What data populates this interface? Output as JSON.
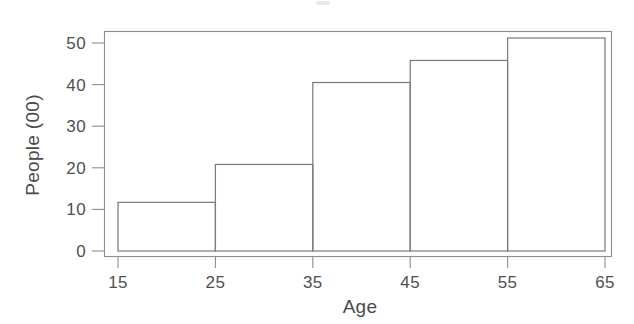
{
  "figure": {
    "background_color": "#ffffff",
    "line_color": "#8e8e8e",
    "text_color": "#4a4a4a"
  },
  "chart_data": {
    "type": "bar",
    "title": "",
    "subtitle": "",
    "xlabel": "Age",
    "ylabel": "People (00)",
    "xlim": [
      15,
      65
    ],
    "ylim": [
      0,
      53
    ],
    "grid": false,
    "legend": null,
    "bin_width": 10,
    "categories": [
      "15-25",
      "25-35",
      "35-45",
      "45-55",
      "55-65"
    ],
    "bin_edges": [
      15,
      25,
      35,
      45,
      55,
      65
    ],
    "values": [
      11.7,
      20.8,
      40.5,
      45.8,
      51.2
    ],
    "xticks": [
      15,
      25,
      35,
      45,
      55,
      65
    ],
    "xtick_labels": [
      "15",
      "25",
      "35",
      "45",
      "55",
      "65"
    ],
    "yticks": [
      0,
      10,
      20,
      30,
      40,
      50
    ],
    "ytick_labels": [
      "0",
      "10",
      "20",
      "30",
      "40",
      "50"
    ],
    "annotations": []
  },
  "axes": {
    "x_title": "Age",
    "y_title": "People (00)",
    "x_tick_0": "15",
    "x_tick_1": "25",
    "x_tick_2": "35",
    "x_tick_3": "45",
    "x_tick_4": "55",
    "x_tick_5": "65",
    "y_tick_0": "0",
    "y_tick_1": "10",
    "y_tick_2": "20",
    "y_tick_3": "30",
    "y_tick_4": "40",
    "y_tick_5": "50"
  }
}
